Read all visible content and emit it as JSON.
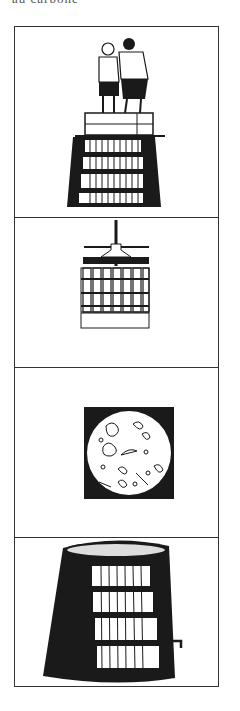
{
  "caption": {
    "text": "au carbone"
  },
  "panels": [
    {
      "id": "treading",
      "subject": "two men treading grapes in a wooden box atop a barrel"
    },
    {
      "id": "press",
      "subject": "screw wine press with slatted cage"
    },
    {
      "id": "microscope",
      "subject": "microscope view of yeast cells"
    },
    {
      "id": "vat",
      "subject": "fermenting vat with hoops and tap"
    }
  ],
  "colors": {
    "ink": "#1a1a1a",
    "frame": "#333333",
    "paper": "#ffffff"
  }
}
